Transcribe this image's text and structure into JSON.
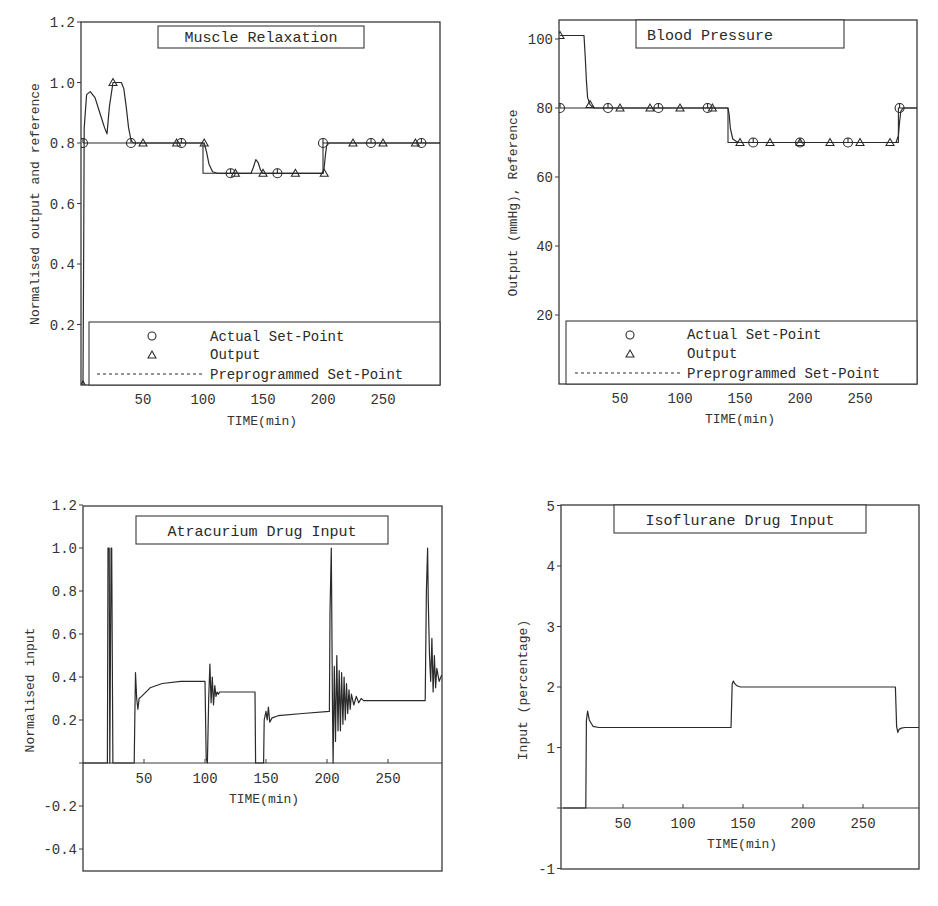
{
  "chart_data": [
    {
      "id": "muscle",
      "type": "line",
      "title": "Muscle Relaxation",
      "xlabel": "TIME(min)",
      "ylabel": "Normalised output and reference",
      "xlim": [
        0,
        298
      ],
      "ylim": [
        0,
        1.2
      ],
      "xticks": [
        50,
        100,
        150,
        200,
        250
      ],
      "xtick_labels": [
        "50",
        "100",
        "150",
        "200",
        "250"
      ],
      "yticks": [
        0.2,
        0.4,
        0.6,
        0.8,
        1.0,
        1.2
      ],
      "ytick_labels": [
        "0.2",
        "0.4",
        "0.6",
        "0.8",
        "1.0",
        "1.2"
      ],
      "grid": false,
      "legend": {
        "position": "lower",
        "entries": [
          {
            "marker": "circle",
            "label": "Actual Set-Point"
          },
          {
            "marker": "triangle",
            "label": "Output"
          },
          {
            "marker": "dashed-line",
            "label": "Preprogrammed Set-Point"
          }
        ]
      },
      "series": [
        {
          "name": "Preprogrammed Set-Point",
          "x": [
            0,
            100,
            100,
            200,
            200,
            298
          ],
          "y": [
            0.8,
            0.8,
            0.7,
            0.7,
            0.8,
            0.8
          ]
        },
        {
          "name": "Output",
          "x": [
            0,
            0.5,
            1,
            3,
            6,
            10,
            14,
            18,
            20,
            22,
            25,
            28,
            32,
            34,
            36,
            38,
            40,
            42,
            60,
            80,
            100,
            101,
            103,
            105,
            108,
            112,
            130,
            140,
            142,
            144,
            146,
            148,
            150,
            170,
            200,
            201,
            202,
            203,
            205,
            230,
            260,
            298
          ],
          "y": [
            0,
            0.4,
            0.85,
            0.96,
            0.97,
            0.95,
            0.9,
            0.85,
            0.83,
            0.92,
            1.0,
            1.0,
            1.0,
            0.98,
            0.92,
            0.85,
            0.81,
            0.8,
            0.8,
            0.8,
            0.8,
            0.8,
            0.77,
            0.73,
            0.705,
            0.7,
            0.7,
            0.7,
            0.72,
            0.745,
            0.735,
            0.71,
            0.7,
            0.7,
            0.7,
            0.72,
            0.76,
            0.79,
            0.8,
            0.8,
            0.8,
            0.8
          ]
        },
        {
          "name": "Actual Set-Point markers",
          "x": [
            0,
            40,
            82,
            123,
            162,
            200,
            240,
            282
          ],
          "y": [
            0.8,
            0.8,
            0.8,
            0.7,
            0.7,
            0.8,
            0.8,
            0.8
          ]
        },
        {
          "name": "Output markers",
          "x": [
            0,
            25,
            50,
            78,
            101,
            127,
            150,
            177,
            201,
            225,
            250,
            277
          ],
          "y": [
            0,
            1.0,
            0.8,
            0.8,
            0.8,
            0.7,
            0.7,
            0.7,
            0.7,
            0.8,
            0.8,
            0.8
          ]
        }
      ]
    },
    {
      "id": "bp",
      "type": "line",
      "title": "Blood Pressure",
      "xlabel": "TIME(min)",
      "ylabel": "Output (mmHg), Reference",
      "xlim": [
        0,
        298
      ],
      "ylim": [
        0,
        105
      ],
      "xticks": [
        50,
        100,
        150,
        200,
        250
      ],
      "xtick_labels": [
        "50",
        "100",
        "150",
        "200",
        "250"
      ],
      "yticks": [
        20,
        40,
        60,
        80,
        100
      ],
      "ytick_labels": [
        "20",
        "40",
        "60",
        "80",
        "100"
      ],
      "grid": false,
      "legend": {
        "position": "lower",
        "entries": [
          {
            "marker": "circle",
            "label": "Actual Set-Point"
          },
          {
            "marker": "triangle",
            "label": "Output"
          },
          {
            "marker": "dashed-line",
            "label": "Preprogrammed Set-Point"
          }
        ]
      },
      "series": [
        {
          "name": "Preprogrammed Set-Point",
          "x": [
            0,
            140,
            140,
            282,
            282,
            298
          ],
          "y": [
            80,
            80,
            70,
            70,
            80,
            80
          ]
        },
        {
          "name": "Output",
          "x": [
            0,
            20,
            21,
            22,
            23,
            25,
            28,
            140,
            141,
            142,
            144,
            147,
            150,
            280,
            282,
            283,
            284,
            286,
            290,
            298
          ],
          "y": [
            101,
            101,
            95,
            88,
            83,
            81,
            80,
            80,
            78,
            74,
            71,
            70.3,
            70,
            70,
            72,
            76,
            79,
            80,
            80,
            80
          ]
        },
        {
          "name": "Actual Set-Point markers",
          "x": [
            0,
            40,
            82,
            123,
            161,
            200,
            240,
            283
          ],
          "y": [
            80,
            80,
            80,
            80,
            70,
            70,
            70,
            80
          ]
        },
        {
          "name": "Output markers",
          "x": [
            0,
            25,
            50,
            75,
            100,
            127,
            150,
            175,
            200,
            225,
            250,
            275
          ],
          "y": [
            101,
            81,
            80,
            80,
            80,
            80,
            70,
            70,
            70,
            70,
            70,
            70
          ]
        }
      ]
    },
    {
      "id": "atracurium",
      "type": "line",
      "title": "Atracurium Drug Input",
      "xlabel": "TIME(min)",
      "ylabel": "Normalised input",
      "xlim": [
        0,
        294
      ],
      "ylim": [
        -0.5,
        1.2
      ],
      "xticks": [
        50,
        100,
        150,
        200,
        250
      ],
      "xtick_labels": [
        "50",
        "100",
        "150",
        "200",
        "250"
      ],
      "yticks": [
        -0.4,
        -0.2,
        0.2,
        0.4,
        0.6,
        0.8,
        1.0,
        1.2
      ],
      "ytick_labels": [
        "-0.4",
        "-0.2",
        "0.2",
        "0.4",
        "0.6",
        "0.8",
        "1.0",
        "1.2"
      ],
      "grid": false,
      "series": [
        {
          "name": "Atracurium input",
          "x": [
            0,
            20,
            20.5,
            21.5,
            22,
            23,
            23.5,
            24.5,
            25,
            42,
            42.5,
            43,
            44,
            45,
            46,
            48,
            55,
            65,
            80,
            100,
            101,
            102,
            103,
            104,
            105,
            106,
            107,
            108,
            109,
            110,
            111,
            112,
            115,
            130,
            141,
            141.5,
            148,
            148.5,
            150,
            151,
            152,
            153,
            155,
            160,
            180,
            202,
            202.5,
            203.5,
            204.5,
            205,
            206,
            207,
            208,
            209,
            210,
            211,
            212,
            213,
            214,
            215,
            216,
            217,
            218,
            219,
            220,
            222,
            224,
            226,
            228,
            230,
            235,
            240,
            280,
            280.5,
            281.5,
            282.5,
            283,
            284,
            285,
            286,
            287,
            288,
            289,
            290,
            292,
            294
          ],
          "y": [
            0,
            0,
            1.0,
            1.0,
            0,
            1.0,
            1.0,
            0,
            0,
            0,
            0.2,
            0.42,
            0.3,
            0.25,
            0.3,
            0.31,
            0.35,
            0.37,
            0.38,
            0.38,
            0.02,
            0.0,
            0.3,
            0.46,
            0.28,
            0.4,
            0.27,
            0.36,
            0.31,
            0.33,
            0.32,
            0.33,
            0.33,
            0.33,
            0.33,
            0.0,
            0.0,
            0.2,
            0.24,
            0.2,
            0.26,
            0.19,
            0.21,
            0.22,
            0.23,
            0.24,
            0.7,
            1.0,
            0.25,
            0.0,
            0.45,
            0.1,
            0.5,
            0.15,
            0.43,
            0.15,
            0.42,
            0.18,
            0.4,
            0.2,
            0.37,
            0.23,
            0.34,
            0.25,
            0.32,
            0.27,
            0.31,
            0.28,
            0.3,
            0.29,
            0.29,
            0.29,
            0.29,
            0.29,
            0.8,
            1.0,
            0.75,
            0.5,
            0.38,
            0.58,
            0.33,
            0.5,
            0.35,
            0.44,
            0.38,
            0.41,
            0.4,
            0.39
          ]
        }
      ]
    },
    {
      "id": "isoflurane",
      "type": "line",
      "title": "Isoflurane Drug Input",
      "xlabel": "TIME(min)",
      "ylabel": "Input (percentage)",
      "xlim": [
        0,
        297
      ],
      "ylim": [
        -1,
        5
      ],
      "xticks": [
        50,
        100,
        150,
        200,
        250
      ],
      "xtick_labels": [
        "50",
        "100",
        "150",
        "200",
        "250"
      ],
      "yticks": [
        -1,
        1,
        2,
        3,
        4,
        5
      ],
      "ytick_labels": [
        "-1",
        "1",
        "2",
        "3",
        "4",
        "5"
      ],
      "grid": false,
      "series": [
        {
          "name": "Isoflurane input",
          "x": [
            0,
            19,
            19.5,
            20.5,
            22,
            25,
            30,
            140,
            141,
            142,
            143,
            145,
            148,
            277,
            278,
            279,
            280,
            282,
            285,
            297
          ],
          "y": [
            0,
            0,
            1.45,
            1.6,
            1.45,
            1.35,
            1.33,
            1.33,
            2.05,
            2.1,
            2.06,
            2.02,
            2.0,
            2.0,
            1.35,
            1.25,
            1.3,
            1.32,
            1.33,
            1.33
          ]
        }
      ]
    }
  ],
  "plots": {
    "muscle": {
      "title": "Muscle Relaxation",
      "ylabel": "Normalised output and reference",
      "xlabel": "TIME(min)",
      "legend": {
        "actual": "Actual Set-Point",
        "output": "Output",
        "preprogrammed": "Preprogrammed Set-Point"
      }
    },
    "bp": {
      "title": "Blood Pressure",
      "ylabel": "Output (mmHg), Reference",
      "xlabel": "TIME(min)",
      "legend": {
        "actual": "Actual Set-Point",
        "output": "Output",
        "preprogrammed": "Preprogrammed Set-Point"
      }
    },
    "atracurium": {
      "title": "Atracurium Drug Input",
      "ylabel": "Normalised input",
      "xlabel": "TIME(min)"
    },
    "isoflurane": {
      "title": "Isoflurane Drug Input",
      "ylabel": "Input (percentage)",
      "xlabel": "TIME(min)"
    }
  }
}
